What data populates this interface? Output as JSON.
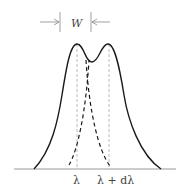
{
  "figure": {
    "width_label": "W",
    "x_labels": {
      "left_line": "λ",
      "right_line_prefix": "λ + d",
      "right_line_suffix": "λ"
    },
    "colors": {
      "curve": "#1a1a1a",
      "dashed_component": "#1a1a1a",
      "guide_lines": "#aaaaaa",
      "baseline": "#999999",
      "arrows": "#888888"
    }
  }
}
